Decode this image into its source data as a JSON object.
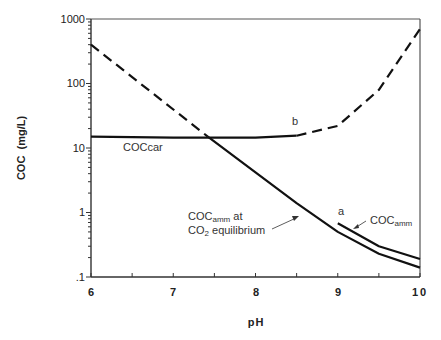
{
  "chart_data": {
    "type": "line",
    "title": "",
    "xlabel": "pH",
    "ylabel": "COC  (mg/L)",
    "xlim": [
      6,
      10
    ],
    "ylim": [
      0.1,
      1000
    ],
    "yscale": "log",
    "grid": false,
    "x_ticks": [
      6,
      7,
      8,
      9,
      10
    ],
    "x_tick_labels": [
      "6",
      "7",
      "8",
      "9",
      "10"
    ],
    "y_ticks": [
      0.1,
      1,
      10,
      100,
      1000
    ],
    "y_tick_labels": [
      ".1",
      "1",
      "10",
      "100",
      "1000"
    ],
    "series": [
      {
        "name": "dashed-descending",
        "style": "dashed",
        "x": [
          6.0,
          7.42
        ],
        "y": [
          400,
          15
        ]
      },
      {
        "name": "COCcar",
        "style": "solid",
        "x": [
          6.0,
          7.0,
          7.42,
          8.0,
          8.5
        ],
        "y": [
          15,
          14.5,
          14.5,
          14.5,
          15.5
        ]
      },
      {
        "name": "COCcar (b, dashed continuation)",
        "style": "dashed",
        "x": [
          8.5,
          9.0,
          9.5,
          10.0
        ],
        "y": [
          15.5,
          22,
          80,
          700
        ]
      },
      {
        "name": "COCamm at CO2 equilibrium",
        "style": "solid",
        "x": [
          7.42,
          8.0,
          8.5,
          9.0,
          9.5,
          10.0
        ],
        "y": [
          15,
          4.2,
          1.4,
          0.5,
          0.23,
          0.14
        ]
      },
      {
        "name": "COCamm (a)",
        "style": "solid",
        "x": [
          9.0,
          9.5,
          10.0
        ],
        "y": [
          0.68,
          0.3,
          0.19
        ]
      }
    ],
    "annotations": [
      {
        "text": "COCcar",
        "x": 6.4,
        "y": 15
      },
      {
        "text": "b",
        "x": 8.4,
        "y": 20
      },
      {
        "text": "a",
        "x": 9.0,
        "y": 0.85
      },
      {
        "text": "COCamm",
        "x": 9.5,
        "y": 0.7,
        "arrow_to": [
          9.25,
          0.45
        ]
      },
      {
        "text": "COCamm at CO2 equilibrium",
        "x": 7.55,
        "y": 0.6,
        "arrow_to": [
          8.65,
          0.85
        ]
      }
    ]
  },
  "labels": {
    "xlabel": "pH",
    "ylabel": "COC  (mg/L)",
    "ann_coccar": "COCcar",
    "ann_b": "b",
    "ann_a": "a",
    "ann_cocamm_main": "COC",
    "ann_cocamm_sub": "amm",
    "ann_eq_line1_main": "COC",
    "ann_eq_line1_sub": "amm",
    "ann_eq_line1_tail": " at",
    "ann_eq_line2_main": "CO",
    "ann_eq_line2_sub": "2",
    "ann_eq_line2_tail": " equilibrium",
    "xticks": [
      "6",
      "7",
      "8",
      "9",
      "10"
    ],
    "yticks": [
      ".1",
      "1",
      "10",
      "100",
      "1000"
    ]
  }
}
